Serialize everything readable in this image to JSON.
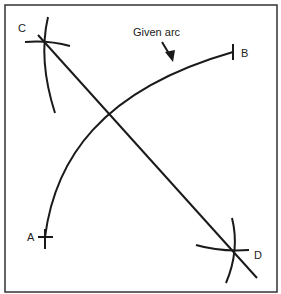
{
  "diagram": {
    "title": "",
    "labels": {
      "C": "C",
      "B": "B",
      "A": "A",
      "D": "D",
      "given_arc": "Given arc"
    },
    "points": {
      "A": [
        45,
        237
      ],
      "B": [
        233,
        52
      ],
      "C": [
        45,
        43
      ],
      "D": [
        233,
        250
      ]
    },
    "colors": {
      "stroke": "#1a1a1a",
      "background": "#ffffff"
    }
  }
}
